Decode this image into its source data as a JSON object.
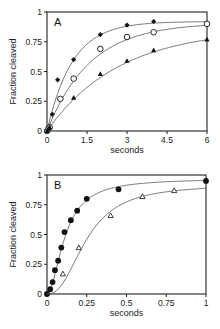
{
  "chart_data": [
    {
      "panel": "A",
      "type": "scatter",
      "title": "",
      "xlabel": "seconds",
      "ylabel": "Fraction  cleaved",
      "xlim": [
        0,
        6
      ],
      "ylim": [
        0,
        1
      ],
      "xticks": [
        0,
        1.5,
        3,
        4.5,
        6
      ],
      "xtick_labels": [
        "0",
        "1.5",
        "3",
        "4.5",
        "6"
      ],
      "yticks": [
        0,
        0.25,
        0.5,
        0.75,
        1
      ],
      "ytick_labels": [
        "0",
        "0.25",
        "0.5",
        "0.75",
        "1"
      ],
      "grid": false,
      "legend": "none",
      "series": [
        {
          "name": "filled diamonds",
          "marker": "diamond-filled",
          "x": [
            0,
            0.05,
            0.1,
            0.2,
            0.4,
            1.0,
            2.0,
            3.0,
            4.0
          ],
          "y": [
            0,
            0.03,
            0.04,
            0.14,
            0.43,
            0.6,
            0.81,
            0.89,
            0.92
          ],
          "fit": {
            "model": "A*(1-exp(-k*t))",
            "A": 0.92,
            "k": 1.05
          }
        },
        {
          "name": "open circles",
          "marker": "circle-open",
          "x": [
            0,
            0.05,
            0.1,
            0.5,
            1.0,
            2.0,
            3.0,
            4.0,
            6.0
          ],
          "y": [
            0,
            0.02,
            0.03,
            0.27,
            0.44,
            0.69,
            0.79,
            0.83,
            0.9
          ],
          "fit": {
            "model": "A*(1-exp(-k*t))",
            "A": 0.91,
            "k": 0.62
          }
        },
        {
          "name": "filled triangles",
          "marker": "triangle-filled",
          "x": [
            0,
            0.05,
            0.1,
            1.0,
            2.0,
            3.0,
            4.0,
            6.0
          ],
          "y": [
            0,
            0.02,
            0.03,
            0.28,
            0.48,
            0.59,
            0.68,
            0.77
          ],
          "fit": {
            "model": "A*(1-exp(-k*t))",
            "A": 0.86,
            "k": 0.37
          }
        }
      ]
    },
    {
      "panel": "B",
      "type": "scatter",
      "title": "",
      "xlabel": "seconds",
      "ylabel": "Fraction  cleaved",
      "xlim": [
        0,
        1
      ],
      "ylim": [
        0,
        1
      ],
      "xticks": [
        0,
        0.25,
        0.5,
        0.75,
        1
      ],
      "xtick_labels": [
        "0",
        "0.25",
        "0.5",
        "0.75",
        "1"
      ],
      "yticks": [
        0,
        0.25,
        0.5,
        0.75,
        1
      ],
      "ytick_labels": [
        "0",
        "0.25",
        "0.5",
        "0.75",
        "1"
      ],
      "grid": false,
      "legend": "none",
      "series": [
        {
          "name": "filled circles",
          "marker": "circle-filled",
          "x": [
            0,
            0.02,
            0.035,
            0.05,
            0.07,
            0.09,
            0.11,
            0.15,
            0.19,
            0.25,
            0.45,
            1.0
          ],
          "y": [
            0,
            0.04,
            0.1,
            0.2,
            0.28,
            0.39,
            0.52,
            0.62,
            0.7,
            0.8,
            0.88,
            0.95
          ],
          "fit": {
            "model": "sigmoidal (lag) rise",
            "A": 0.96
          }
        },
        {
          "name": "open triangles",
          "marker": "triangle-open",
          "x": [
            0.1,
            0.2,
            0.4,
            0.6,
            0.8
          ],
          "y": [
            0.17,
            0.39,
            0.66,
            0.82,
            0.87
          ],
          "fit": {
            "model": "sigmoidal (lag) rise",
            "A": 0.9
          }
        }
      ]
    }
  ],
  "panels": {
    "A": {
      "letter": "A",
      "xlabel": "seconds",
      "ylabel": "Fraction  cleaved"
    },
    "B": {
      "letter": "B",
      "xlabel": "seconds",
      "ylabel": "Fraction  cleaved"
    }
  }
}
